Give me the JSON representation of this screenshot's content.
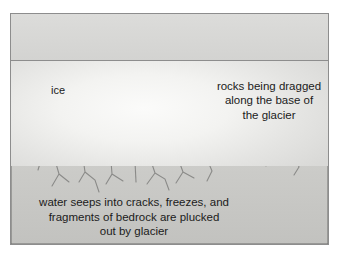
{
  "figure": {
    "labels": {
      "ice": "ice",
      "rocks_dragged_line1": "rocks being dragged",
      "rocks_dragged_line2": "along the base of",
      "rocks_dragged_line3": "the glacier",
      "caption_line1": "water seeps into cracks, freezes, and",
      "caption_line2": "fragments of bedrock are plucked",
      "caption_line3": "out by glacier"
    },
    "colors": {
      "frame_border": "#8d8d8d",
      "sky_band": "#d8d8d6",
      "ice_light": "#fbfbfa",
      "ice_shade": "#d9d9d7",
      "bedrock": "#c9c9c6",
      "rock_dark": "#8f8f8c",
      "rock_mid": "#a9a9a5",
      "rock_light": "#d5d5d1",
      "outline": "#4a4a48",
      "text": "#1b1b1b",
      "arrow_tip": "#4d4d4d",
      "arrow_tail": "#e8e8e6"
    },
    "arrow": {
      "name": "ice-flow-arrow",
      "direction": "right",
      "x_start": 75,
      "x_end": 185,
      "y": 78
    },
    "pointer_line": {
      "name": "rocks-pointer-line",
      "x": 257,
      "y_top": 104,
      "y_bottom": 147
    }
  }
}
